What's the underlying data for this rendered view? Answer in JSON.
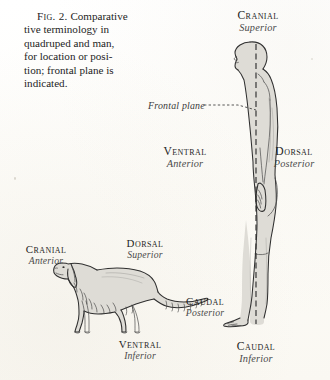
{
  "figure": {
    "number_label": "Fig. 2.",
    "caption_rest": "Comparative terminology in quadruped and man, for location or position; frontal plane is indicated.",
    "caption_lines": [
      "Comparative",
      "tive terminology in",
      "quadruped and man,",
      "for location or posi-",
      "tion; frontal plane is",
      "indicated."
    ]
  },
  "colors": {
    "paper": "#fdfdfb",
    "ink": "#2a2a2a",
    "figure_fill": "#dedcd6",
    "figure_outline": "#2f2f2f",
    "alt_term": "#4b4b4b"
  },
  "annotations": {
    "frontal_plane": "Frontal plane"
  },
  "human": {
    "name": "man",
    "labels": {
      "top": {
        "term": "Cranial",
        "alt": "Superior"
      },
      "front": {
        "term": "Ventral",
        "alt": "Anterior"
      },
      "back": {
        "term": "Dorsal",
        "alt": "Posterior"
      },
      "bottom": {
        "term": "Caudal",
        "alt": "Inferior"
      }
    }
  },
  "quadruped": {
    "name": "dog",
    "labels": {
      "head": {
        "term": "Cranial",
        "alt": "Anterior"
      },
      "back": {
        "term": "Dorsal",
        "alt": "Superior"
      },
      "tail": {
        "term": "Caudal",
        "alt": "Posterior"
      },
      "belly": {
        "term": "Ventral",
        "alt": "Inferior"
      }
    }
  }
}
